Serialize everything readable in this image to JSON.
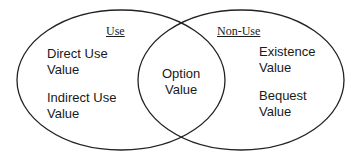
{
  "diagram": {
    "type": "venn",
    "sets": [
      {
        "id": "use",
        "title": "Use",
        "items": [
          "Direct Use Value",
          "Indirect Use Value"
        ]
      },
      {
        "id": "non-use",
        "title": "Non-Use",
        "items": [
          "Existence Value",
          "Bequest Value"
        ]
      }
    ],
    "intersection": {
      "items": [
        "Option Value"
      ]
    }
  },
  "labels": {
    "use_title": "Use",
    "nonuse_title": "Non-Use",
    "direct_1": "Direct Use",
    "direct_2": "Value",
    "indirect_1": "Indirect Use",
    "indirect_2": "Value",
    "option_1": "Option",
    "option_2": "Value",
    "existence_1": "Existence",
    "existence_2": "Value",
    "bequest_1": "Bequest",
    "bequest_2": "Value"
  }
}
